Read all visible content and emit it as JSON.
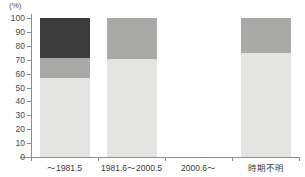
{
  "chart_data": {
    "type": "bar",
    "subtype": "stacked-100-percent",
    "title": "",
    "subtitle": "",
    "xlabel": "",
    "ylabel": "",
    "unit_label": "(%)",
    "ylim": [
      0,
      100
    ],
    "ytick_values": [
      0,
      10,
      20,
      30,
      40,
      50,
      60,
      70,
      80,
      90,
      100
    ],
    "ytick_labels": [
      "0",
      "10",
      "20",
      "30",
      "40",
      "50",
      "60",
      "70",
      "80",
      "90",
      "100"
    ],
    "grid": false,
    "legend": "none",
    "categories": [
      "～1981.5",
      "1981.6～2000.5",
      "2000.6～",
      "時期不明"
    ],
    "series": [
      {
        "name": "light",
        "color": "#e4e4e2",
        "values": [
          57,
          70.5,
          null,
          75
        ]
      },
      {
        "name": "medium",
        "color": "#a9a9a7",
        "values": [
          14,
          29.5,
          null,
          25
        ]
      },
      {
        "name": "dark",
        "color": "#3b3b3b",
        "values": [
          29,
          0,
          null,
          0
        ]
      }
    ],
    "bars": [
      {
        "category": "～1981.5",
        "has_data": true,
        "segments": [
          {
            "series": "light",
            "start": 0,
            "end": 57,
            "value": 57,
            "color": "#e4e4e2"
          },
          {
            "series": "medium",
            "start": 57,
            "end": 71,
            "value": 14,
            "color": "#a9a9a7"
          },
          {
            "series": "dark",
            "start": 71,
            "end": 100,
            "value": 29,
            "color": "#3b3b3b"
          }
        ]
      },
      {
        "category": "1981.6～2000.5",
        "has_data": true,
        "segments": [
          {
            "series": "light",
            "start": 0,
            "end": 70.5,
            "value": 70.5,
            "color": "#e4e4e2"
          },
          {
            "series": "medium",
            "start": 70.5,
            "end": 100,
            "value": 29.5,
            "color": "#a9a9a7"
          }
        ]
      },
      {
        "category": "2000.6～",
        "has_data": false,
        "segments": []
      },
      {
        "category": "時期不明",
        "has_data": true,
        "segments": [
          {
            "series": "light",
            "start": 0,
            "end": 75,
            "value": 75,
            "color": "#e4e4e2"
          },
          {
            "series": "medium",
            "start": 75,
            "end": 100,
            "value": 25,
            "color": "#a9a9a7"
          }
        ]
      }
    ],
    "colors": {
      "light": "#e4e4e2",
      "medium": "#a9a9a7",
      "dark": "#3b3b3b",
      "axis": "#8d8d8d",
      "text": "#3a3a3a",
      "background": "#ffffff"
    }
  }
}
